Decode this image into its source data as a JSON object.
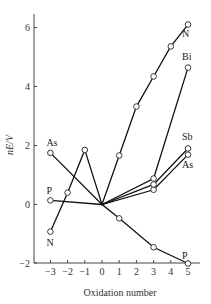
{
  "chart_data": {
    "type": "line",
    "title": "",
    "xlabel": "Oxidation number",
    "ylabel": "nE/V",
    "xlim": [
      -3.5,
      5.5
    ],
    "ylim": [
      -2,
      6.5
    ],
    "x_ticks": [
      -3,
      -2,
      -1,
      0,
      1,
      2,
      3,
      4,
      5
    ],
    "x_tick_labels": [
      "−3",
      "−2",
      "−1",
      "0",
      "1",
      "2",
      "3",
      "4",
      "5"
    ],
    "y_ticks": [
      -2,
      0,
      2,
      4,
      6
    ],
    "y_tick_labels": [
      "−2",
      "0",
      "2",
      "4",
      "6"
    ],
    "grid": false,
    "legend": "inline labels at line ends",
    "series": [
      {
        "name": "N",
        "x": [
          -3,
          -2,
          -1,
          0,
          1,
          2,
          3,
          4,
          5
        ],
        "values": [
          -0.92,
          0.4,
          1.85,
          0,
          1.66,
          3.32,
          4.34,
          5.36,
          6.1
        ],
        "label_pos": [
          "start",
          "end"
        ]
      },
      {
        "name": "P",
        "x": [
          -3,
          0,
          1,
          3,
          5
        ],
        "values": [
          0.14,
          0,
          -0.47,
          -1.45,
          -2.0
        ],
        "label_pos": [
          "start",
          "end"
        ]
      },
      {
        "name": "As",
        "x": [
          -3,
          0,
          3,
          5
        ],
        "values": [
          1.75,
          0,
          0.5,
          1.69
        ],
        "label_pos": [
          "start",
          "end"
        ]
      },
      {
        "name": "Sb",
        "x": [
          0,
          3,
          5
        ],
        "values": [
          0,
          0.68,
          1.9
        ],
        "label_pos": [
          "end"
        ]
      },
      {
        "name": "Bi",
        "x": [
          0,
          3,
          5
        ],
        "values": [
          0,
          0.88,
          4.64
        ],
        "label_pos": [
          "end"
        ]
      }
    ]
  }
}
